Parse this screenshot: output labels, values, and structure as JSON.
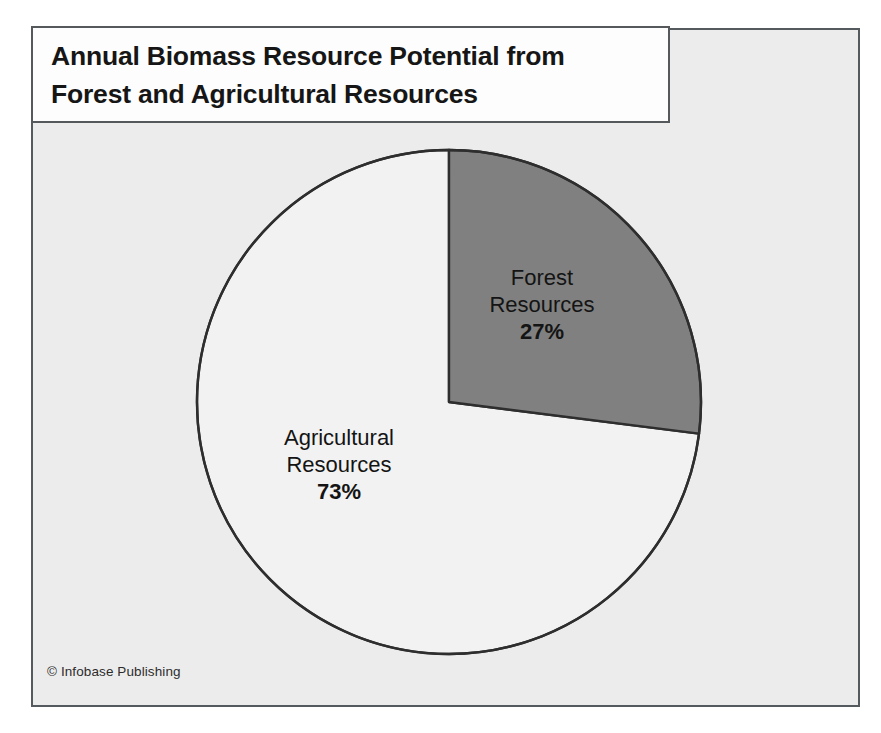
{
  "title": {
    "line1": "Annual Biomass Resource Potential from",
    "line2": "Forest and Agricultural Resources"
  },
  "credit": "© Infobase Publishing",
  "labels": {
    "forest": {
      "line1": "Forest",
      "line2": "Resources",
      "percent": "27%"
    },
    "agricultural": {
      "line1": "Agricultural",
      "line2": "Resources",
      "percent": "73%"
    }
  },
  "colors": {
    "page_background": "#ffffff",
    "frame_background": "#ececec",
    "frame_border": "#555a5e",
    "title_background": "#fdfdfd",
    "title_border": "#55595c",
    "slice_forest": "#808080",
    "slice_agricultural": "#f2f2f2",
    "slice_outline": "#2e2e2e",
    "text": "#141414"
  },
  "chart_data": {
    "type": "pie",
    "title": "Annual Biomass Resource Potential from Forest and Agricultural Resources",
    "categories": [
      "Forest Resources",
      "Agricultural Resources"
    ],
    "values": [
      27,
      73
    ],
    "value_unit": "percent",
    "data_labels": [
      "27%",
      "73%"
    ],
    "slice_colors": [
      "#808080",
      "#f2f2f2"
    ],
    "start_angle_deg": 0,
    "direction": "clockwise",
    "legend": "none",
    "labels_position": "inside-slices",
    "grid": false,
    "annotations": [
      "© Infobase Publishing"
    ]
  }
}
